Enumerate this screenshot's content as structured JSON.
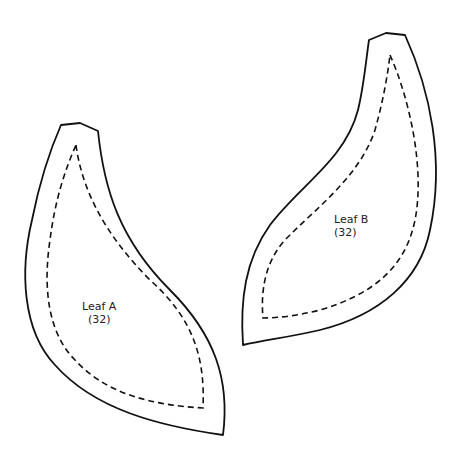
{
  "pieces": [
    {
      "name": "Leaf A",
      "count": "(32)"
    },
    {
      "name": "Leaf B",
      "count": "(32)"
    }
  ],
  "colors": {
    "outline": "#111111",
    "background": "#ffffff"
  },
  "legend": {
    "solid_line": "cutting-line",
    "dashed_line": "sewing-line"
  }
}
